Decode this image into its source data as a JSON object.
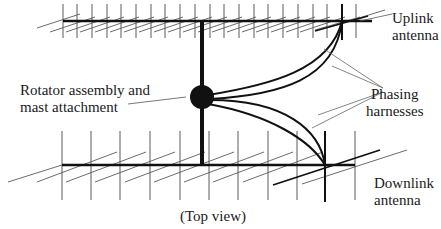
{
  "diagram": {
    "caption": "(Top view)",
    "labels": {
      "uplink": {
        "line1": "Uplink",
        "line2": "antenna"
      },
      "rotator": {
        "line1": "Rotator assembly and",
        "line2": "mast attachment"
      },
      "phasing": {
        "line1": "Phasing",
        "line2": "harnesses"
      },
      "downlink": {
        "line1": "Downlink",
        "line2": "antenna"
      }
    },
    "colors": {
      "ink": "#1a1a1a",
      "thin_line": "#4a4a4a",
      "background": "#ffffff"
    },
    "components": [
      "uplink-antenna",
      "downlink-antenna",
      "mast",
      "rotator-assembly",
      "phasing-harness-upper",
      "phasing-harness-lower"
    ]
  }
}
